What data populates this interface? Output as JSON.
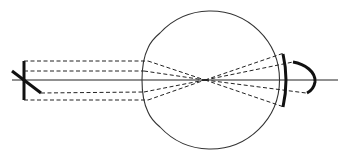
{
  "diagram": {
    "title": "",
    "colors": {
      "line": "#222222",
      "background": "#ffffff"
    },
    "elements": {
      "optical_axis": {
        "x1": 12,
        "y1": 80,
        "x2": 338,
        "y2": 80
      },
      "object_bar": {
        "x1": 24,
        "y1": 61,
        "x2": 24,
        "y2": 100
      },
      "object_diagonal": {
        "x1": 12,
        "y1": 71,
        "x2": 41,
        "y2": 93
      },
      "eyeball": {
        "cx": 218,
        "cy": 80,
        "r": 69
      },
      "nodal_point": {
        "x": 205,
        "y": 80
      },
      "retina_arc": {
        "top_y": 55,
        "bottom_y": 107,
        "x": 285
      },
      "image_curve": {
        "start": [
          293,
          62
        ],
        "apex_x": 315,
        "end": [
          308,
          93
        ]
      }
    },
    "labels": []
  }
}
